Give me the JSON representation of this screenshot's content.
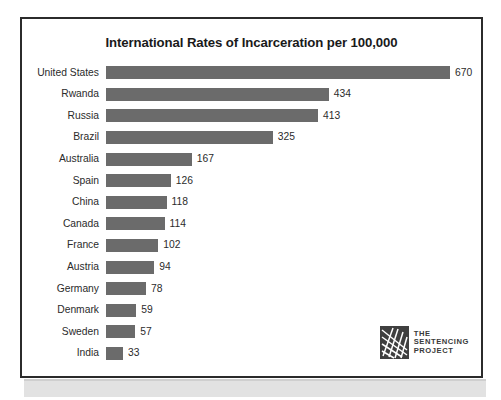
{
  "figure": {
    "title": "International Rates of Incarceration per 100,000",
    "border_color": "#2b2b2b",
    "background": "#ffffff"
  },
  "logo": {
    "mark_name": "sentencing-project-weave-mark",
    "line1": "THE",
    "line2": "SENTENCING",
    "line3": "PROJECT",
    "color": "#3f3f3f"
  },
  "chart_data": {
    "type": "bar",
    "orientation": "horizontal",
    "title": "International Rates of Incarceration per 100,000",
    "xlabel": "",
    "ylabel": "",
    "xlim": [
      0,
      670
    ],
    "grid": false,
    "legend": false,
    "bar_color": "#6b6b6b",
    "value_labels": true,
    "categories": [
      "United States",
      "Rwanda",
      "Russia",
      "Brazil",
      "Australia",
      "Spain",
      "China",
      "Canada",
      "France",
      "Austria",
      "Germany",
      "Denmark",
      "Sweden",
      "India"
    ],
    "values": [
      670,
      434,
      413,
      325,
      167,
      126,
      118,
      114,
      102,
      94,
      78,
      59,
      57,
      33
    ]
  }
}
